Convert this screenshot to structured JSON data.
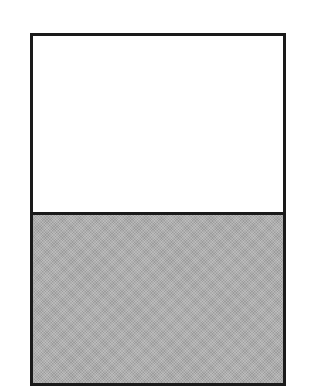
{
  "diagram": {
    "type": "partitioned-rectangle",
    "regions": [
      {
        "name": "top",
        "fill": "#ffffff",
        "fraction": 0.5
      },
      {
        "name": "bottom",
        "fill": "#adadad",
        "pattern": "dithered",
        "fraction": 0.5
      }
    ],
    "border_color": "#1a1a1a"
  }
}
